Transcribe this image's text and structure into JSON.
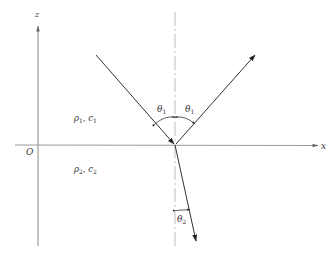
{
  "diagram": {
    "type": "reflection-refraction",
    "axes": {
      "z_label": "z",
      "x_label": "x",
      "origin_label": "O"
    },
    "media": {
      "upper": {
        "rho": "ρ",
        "rho_sub": "1",
        "sep": ", ",
        "c": "c",
        "c_sub": "1"
      },
      "lower": {
        "rho": "ρ",
        "rho_sub": "2",
        "sep": ", ",
        "c": "c",
        "c_sub": "2"
      }
    },
    "angles": {
      "incident": {
        "symbol": "θ",
        "sub": "1"
      },
      "reflected": {
        "symbol": "θ",
        "sub": "1"
      },
      "refracted": {
        "symbol": "θ",
        "sub": "2"
      }
    },
    "rays": [
      "incident",
      "reflected",
      "refracted"
    ],
    "colors": {
      "line": "#333333",
      "axis": "#777777",
      "normal": "#999999"
    }
  }
}
